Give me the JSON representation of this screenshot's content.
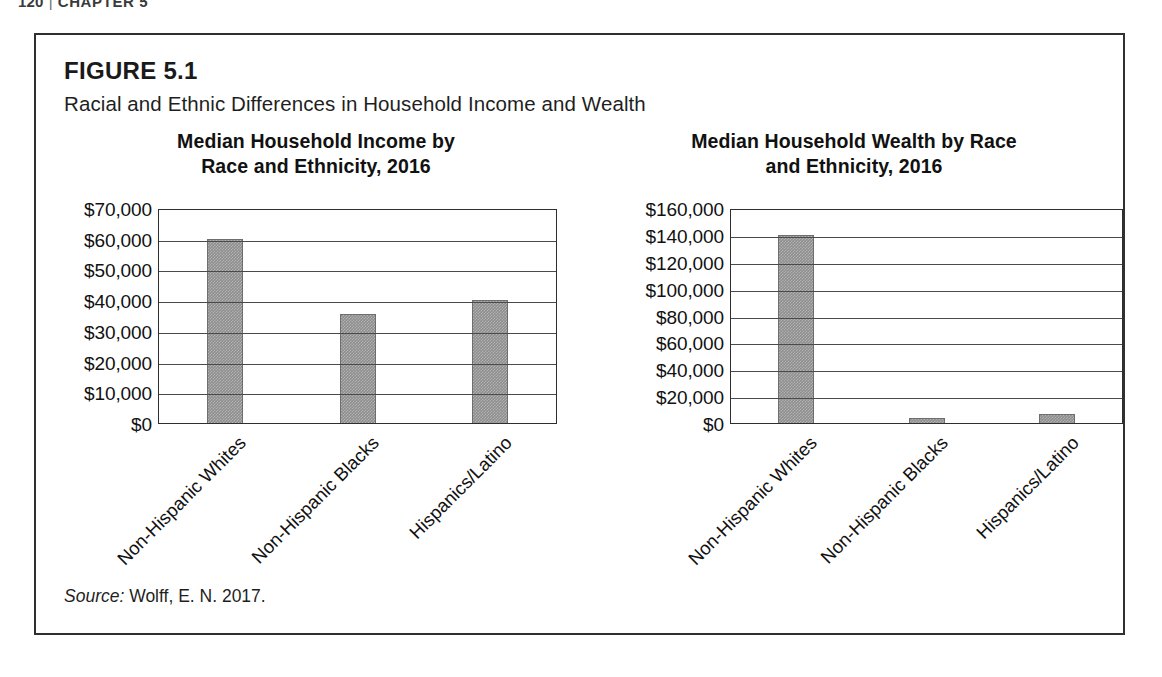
{
  "page": {
    "running_head_number": "120",
    "running_head_separator": "|",
    "running_head_chapter": "CHAPTER 5"
  },
  "figure": {
    "label": "FIGURE 5.1",
    "caption": "Racial and Ethnic Differences in Household Income and Wealth",
    "source_keyword": "Source:",
    "source_text": "Wolff, E. N. 2017."
  },
  "chart_data": [
    {
      "type": "bar",
      "title": "Median Household Income by Race and Ethnicity, 2016",
      "title_line1": "Median Household Income by",
      "title_line2": "Race and Ethnicity, 2016",
      "categories": [
        "Non-Hispanic Whites",
        "Non-Hispanic Blacks",
        "Hispanics/Latino"
      ],
      "values": [
        60000,
        35400,
        40000
      ],
      "xlabel": "",
      "ylabel": "",
      "ylim": [
        0,
        70000
      ],
      "ytick_values": [
        0,
        10000,
        20000,
        30000,
        40000,
        50000,
        60000,
        70000
      ],
      "ytick_labels": [
        "$0",
        "$10,000",
        "$20,000",
        "$30,000",
        "$40,000",
        "$50,000",
        "$60,000",
        "$70,000"
      ],
      "grid": true,
      "legend": "none",
      "bar_color": "#8e8e8e"
    },
    {
      "type": "bar",
      "title": "Median Household Wealth by Race and Ethnicity, 2016",
      "title_line1": "Median Household Wealth by Race",
      "title_line2": "and Ethnicity, 2016",
      "categories": [
        "Non-Hispanic Whites",
        "Non-Hispanic Blacks",
        "Hispanics/Latino"
      ],
      "values": [
        140000,
        3500,
        6500
      ],
      "xlabel": "",
      "ylabel": "",
      "ylim": [
        0,
        160000
      ],
      "ytick_values": [
        0,
        20000,
        40000,
        60000,
        80000,
        100000,
        120000,
        140000,
        160000
      ],
      "ytick_labels": [
        "$0",
        "$20,000",
        "$40,000",
        "$60,000",
        "$80,000",
        "$100,000",
        "$120,000",
        "$140,000",
        "$160,000"
      ],
      "grid": true,
      "legend": "none",
      "bar_color": "#8e8e8e"
    }
  ]
}
